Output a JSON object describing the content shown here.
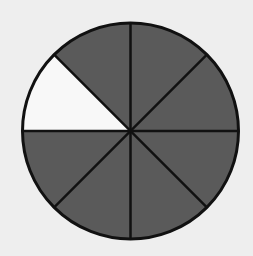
{
  "diagram": {
    "type": "fraction-circle",
    "total_parts": 8,
    "shaded_parts": 7,
    "unshaded_parts": 1,
    "fraction_shaded": "7/8",
    "unshaded_segment_position": "upper-left, between 9 o'clock and 10:30",
    "colors": {
      "background": "#eeeeee",
      "shaded": "#5a5a5a",
      "unshaded": "#f8f8f8",
      "outline": "#111111"
    }
  }
}
